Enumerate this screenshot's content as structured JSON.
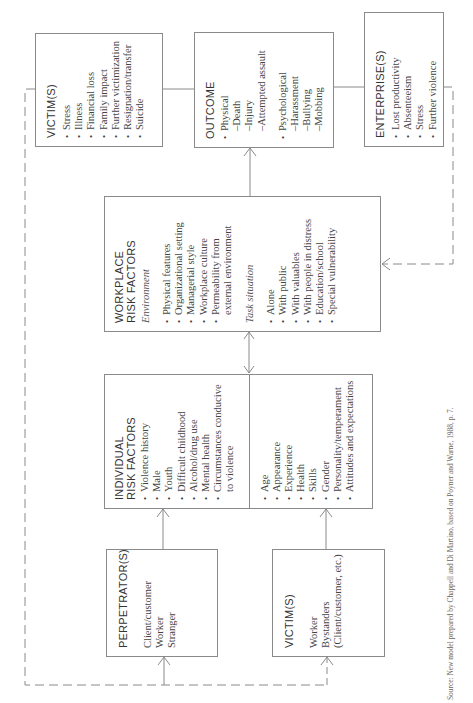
{
  "diagram": {
    "victims_outcome": {
      "title": "VICTIM(S)",
      "items": [
        "Stress",
        "Illness",
        "Financial loss",
        "Family impact",
        "Further victimization",
        "Resignation/transfer",
        "Suicide"
      ]
    },
    "outcome": {
      "title": "OUTCOME",
      "physical": "Physical",
      "physical_items": [
        "Death",
        "Injury",
        "Attempted assault"
      ],
      "psychological": "Psychological",
      "psychological_items": [
        "Harassment",
        "Bullying",
        "Mobbing"
      ]
    },
    "enterprise": {
      "title": "ENTERPRISE(S)",
      "items": [
        "Lost productivity",
        "Absenteeism",
        "Stress",
        "Further violence"
      ]
    },
    "workplace": {
      "title_line1": "WORKPLACE",
      "title_line2": "RISK FACTORS",
      "environment_label": "Environment",
      "environment_items": [
        "Physical features",
        "Organizational setting",
        "Managerial style",
        "Workplace culture",
        "Permeability from"
      ],
      "environment_cont": "external environment",
      "task_label": "Task situation",
      "task_items": [
        "Alone",
        "With public",
        "With valuables",
        "With people in distress",
        "Education/school",
        "Special vulnerability"
      ]
    },
    "individual": {
      "title_line1": "INDIVIDUAL",
      "title_line2": "RISK FACTORS",
      "perpetrator_items": [
        "Violence history",
        "Male",
        "Youth",
        "Difficult childhood",
        "Alcohol/drug use",
        "Mental health",
        "Circumstances conducive"
      ],
      "perpetrator_cont": "to violence",
      "victim_items": [
        "Age",
        "Appearance",
        "Experience",
        "Health",
        "Skills",
        "Gender",
        "Personality/temperament",
        "Attitudes and expectations"
      ]
    },
    "perpetrators": {
      "title": "PERPETRATOR(S)",
      "items": [
        "Client/customer",
        "Worker",
        "Stranger"
      ]
    },
    "victims_input": {
      "title": "VICTIM(S)",
      "items": [
        "Worker",
        "Bystanders",
        "(Client/customer, etc.)"
      ]
    },
    "source": "Source: New model prepared by Chappell and Di Martino, based on Poyner and Warne, 1988, p. 7."
  }
}
